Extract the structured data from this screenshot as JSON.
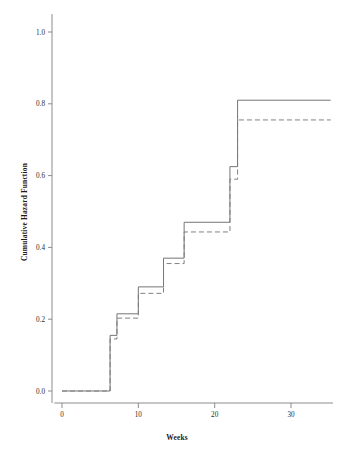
{
  "chart_data": {
    "type": "line",
    "subtype": "step-post",
    "title": "",
    "xlabel": "Weeks",
    "ylabel": "Cumulative Hazard Function",
    "xlim": [
      -1,
      35.5
    ],
    "ylim": [
      -0.03,
      1.05
    ],
    "xticks": [
      0,
      10,
      20,
      30
    ],
    "xticklabels": [
      "0",
      "10",
      "20",
      "30"
    ],
    "yticks": [
      0.0,
      0.2,
      0.4,
      0.6,
      0.8,
      1.0
    ],
    "yticklabels": [
      "0.0",
      "0.2",
      "0.4",
      "0.6",
      "0.8",
      "1.0"
    ],
    "grid": false,
    "legend": "none",
    "series": [
      {
        "name": "solid-step",
        "style": "solid",
        "color": "#6e6e6e",
        "x": [
          0,
          6.3,
          6.3,
          7.2,
          7.2,
          10.0,
          10.0,
          13.3,
          13.3,
          16.0,
          16.0,
          22.0,
          22.0,
          23.0,
          23.0,
          35.2
        ],
        "y": [
          0.0,
          0.0,
          0.155,
          0.155,
          0.215,
          0.215,
          0.29,
          0.29,
          0.37,
          0.37,
          0.47,
          0.47,
          0.625,
          0.625,
          0.81,
          0.81
        ]
      },
      {
        "name": "dashed-step",
        "style": "dashed",
        "color": "#7a7a7a",
        "x": [
          0,
          6.3,
          6.3,
          7.2,
          7.2,
          10.0,
          10.0,
          13.3,
          13.3,
          16.0,
          16.0,
          22.0,
          22.0,
          23.0,
          23.0,
          35.2
        ],
        "y": [
          0.0,
          0.0,
          0.145,
          0.145,
          0.203,
          0.203,
          0.272,
          0.272,
          0.355,
          0.355,
          0.443,
          0.443,
          0.59,
          0.59,
          0.755,
          0.755
        ]
      }
    ]
  },
  "axes": {
    "x_title": "Weeks",
    "y_title": "Cumulative Hazard Function"
  }
}
